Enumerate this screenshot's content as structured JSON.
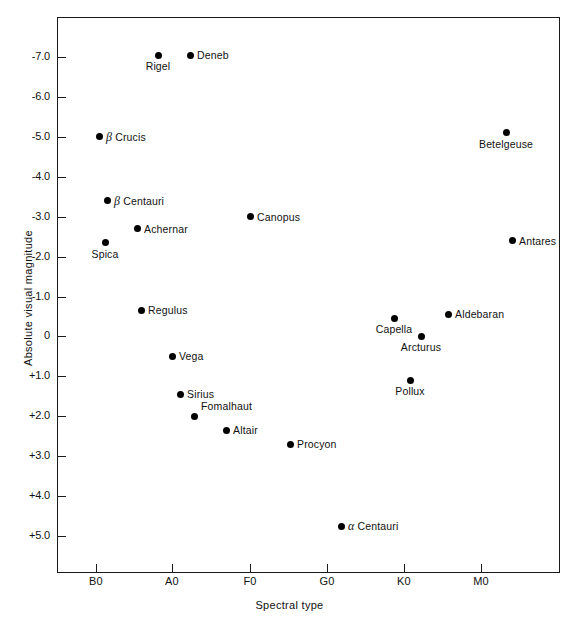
{
  "chart_data": {
    "type": "scatter",
    "title": "",
    "xlabel": "Spectral type",
    "ylabel": "Absolute visual magnitude",
    "grid": false,
    "legend": null,
    "xtick_labels": [
      "B0",
      "A0",
      "F0",
      "G0",
      "K0",
      "M0"
    ],
    "xtick_positions": [
      96,
      172,
      250,
      327,
      404,
      481
    ],
    "ytick_labels": [
      "-7.0",
      "-6.0",
      "-5.0",
      "-4.0",
      "-3.0",
      "-2.0",
      "-1.0",
      "0",
      "+1.0",
      "+2.0",
      "+3.0",
      "+4.0",
      "+5.0"
    ],
    "ytick_values": [
      -7.0,
      -6.0,
      -5.0,
      -4.0,
      -3.0,
      -2.0,
      -1.0,
      0,
      1.0,
      2.0,
      3.0,
      4.0,
      5.0
    ],
    "ylim": [
      -7.6,
      5.6
    ],
    "yaxis_inverted": true,
    "points": [
      {
        "label": "Rigel",
        "x_px": 158,
        "y_mag": -7.05,
        "label_pos": "below"
      },
      {
        "label": "Deneb",
        "x_px": 190,
        "y_mag": -7.05,
        "label_pos": "right"
      },
      {
        "label": "β Crucis",
        "x_px": 99,
        "y_mag": -5.0,
        "label_pos": "right",
        "italic_prefix": "β",
        "rest": " Crucis"
      },
      {
        "label": "Betelgeuse",
        "x_px": 506,
        "y_mag": -5.1,
        "label_pos": "below"
      },
      {
        "label": "β Centauri",
        "x_px": 107,
        "y_mag": -3.4,
        "label_pos": "right",
        "italic_prefix": "β",
        "rest": " Centauri"
      },
      {
        "label": "Canopus",
        "x_px": 250,
        "y_mag": -3.0,
        "label_pos": "right"
      },
      {
        "label": "Achernar",
        "x_px": 137,
        "y_mag": -2.7,
        "label_pos": "right"
      },
      {
        "label": "Antares",
        "x_px": 512,
        "y_mag": -2.4,
        "label_pos": "right"
      },
      {
        "label": "Spica",
        "x_px": 105,
        "y_mag": -2.35,
        "label_pos": "below"
      },
      {
        "label": "Regulus",
        "x_px": 141,
        "y_mag": -0.65,
        "label_pos": "right"
      },
      {
        "label": "Aldebaran",
        "x_px": 448,
        "y_mag": -0.55,
        "label_pos": "right"
      },
      {
        "label": "Capella",
        "x_px": 394,
        "y_mag": -0.45,
        "label_pos": "below"
      },
      {
        "label": "Arcturus",
        "x_px": 421,
        "y_mag": 0.0,
        "label_pos": "below"
      },
      {
        "label": "Vega",
        "x_px": 172,
        "y_mag": 0.5,
        "label_pos": "right"
      },
      {
        "label": "Pollux",
        "x_px": 410,
        "y_mag": 1.1,
        "label_pos": "below"
      },
      {
        "label": "Sirius",
        "x_px": 180,
        "y_mag": 1.45,
        "label_pos": "right"
      },
      {
        "label": "Fomalhaut",
        "x_px": 194,
        "y_mag": 2.0,
        "label_pos": "above-right"
      },
      {
        "label": "Altair",
        "x_px": 226,
        "y_mag": 2.35,
        "label_pos": "right"
      },
      {
        "label": "Procyon",
        "x_px": 290,
        "y_mag": 2.7,
        "label_pos": "right"
      },
      {
        "label": "α Centauri",
        "x_px": 341,
        "y_mag": 4.75,
        "label_pos": "right",
        "italic_prefix": "α",
        "rest": " Centauri"
      }
    ]
  }
}
